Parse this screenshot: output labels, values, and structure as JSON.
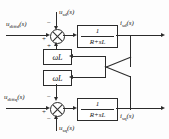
{
  "diagram": {
    "line_color": "#2b2b2b",
    "background": "#fdfdfd",
    "inputs": [
      {
        "name": "u-diffd",
        "base": "u",
        "sub": "diffd",
        "arg": "(s)",
        "text": "u_diffd(s)"
      },
      {
        "name": "u-diffq",
        "base": "u",
        "sub": "diffq",
        "arg": "(s)",
        "text": "u_diffq(s)"
      }
    ],
    "disturbances": [
      {
        "name": "u-sd",
        "base": "u",
        "sub": "sd",
        "arg": "(s)",
        "text": "u_sd(s)"
      },
      {
        "name": "u-sq",
        "base": "u",
        "sub": "sq",
        "arg": "(s)",
        "text": "u_sq(s)"
      }
    ],
    "outputs": [
      {
        "name": "i-sd",
        "base": "i",
        "sub": "sd",
        "arg": "(s)",
        "text": "i_sd(s)"
      },
      {
        "name": "i-sq",
        "base": "i",
        "sub": "sq",
        "arg": "(s)",
        "text": "i_sq(s)"
      }
    ],
    "plant_blocks": [
      {
        "name": "plant-d",
        "numerator": "1",
        "denominator": "R+sL"
      },
      {
        "name": "plant-q",
        "numerator": "1",
        "denominator": "R+sL"
      }
    ],
    "coupling_blocks": [
      {
        "name": "coupling-gain-upper",
        "label": "ωL"
      },
      {
        "name": "coupling-gain-lower",
        "label": "ωL"
      }
    ],
    "summing_junctions": [
      {
        "name": "sum-d",
        "signs": {
          "left": "+",
          "top": "−",
          "bottom": "+"
        }
      },
      {
        "name": "sum-q",
        "signs": {
          "left": "+",
          "top": "−",
          "bottom": "−"
        }
      }
    ]
  }
}
